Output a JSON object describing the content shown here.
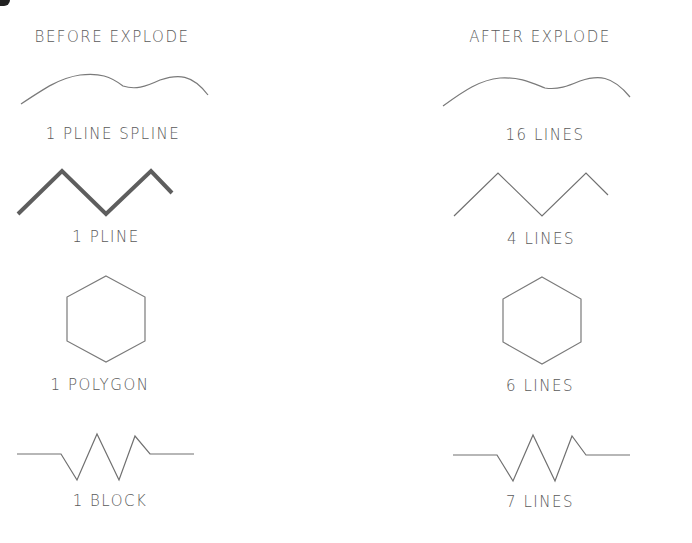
{
  "headers": {
    "before": "BEFORE EXPLODE",
    "after": "AFTER EXPLODE"
  },
  "rows": [
    {
      "shape": "spline",
      "before_label": "1 PLINE SPLINE",
      "after_label": "16 LINES"
    },
    {
      "shape": "zigzag",
      "before_label": "1 PLINE",
      "after_label": "4 LINES"
    },
    {
      "shape": "hexagon",
      "before_label": "1 POLYGON",
      "after_label": "6 LINES"
    },
    {
      "shape": "resistor",
      "before_label": "1 BLOCK",
      "after_label": "7 LINES"
    }
  ],
  "colors": {
    "line": "#6a6a6a",
    "thick_pline": "#5a5a5a",
    "text": "#5a5a5a"
  }
}
